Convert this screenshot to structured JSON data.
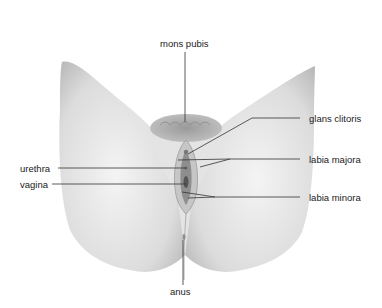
{
  "diagram": {
    "type": "anatomical-labeled-illustration",
    "style": "grayscale pencil illustration",
    "labels": [
      {
        "id": "mons-pubis",
        "text": "mons pubis"
      },
      {
        "id": "glans-clitoris",
        "text": "glans clitoris"
      },
      {
        "id": "labia-majora",
        "text": "labia majora"
      },
      {
        "id": "urethra",
        "text": "urethra"
      },
      {
        "id": "vagina",
        "text": "vagina"
      },
      {
        "id": "labia-minora",
        "text": "labia minora"
      },
      {
        "id": "anus",
        "text": "anus"
      }
    ]
  },
  "colors": {
    "background": "#ffffff",
    "skin_light": "#eeeeee",
    "skin_mid": "#cfcfcf",
    "skin_shadow": "#a8a8a8",
    "leader_line": "#333333",
    "label_text": "#222222"
  }
}
